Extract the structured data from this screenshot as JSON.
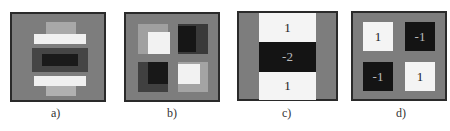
{
  "figure": {
    "panels": [
      {
        "id": "a",
        "label": "a)",
        "description": "Learned vertical second-derivative filter (Gaussian approximation)"
      },
      {
        "id": "b",
        "label": "b)",
        "description": "Learned mixed xy second-derivative filter"
      },
      {
        "id": "c",
        "label": "c)",
        "description": "Box filter approximation Dyy",
        "values": [
          "1",
          "-2",
          "1"
        ]
      },
      {
        "id": "d",
        "label": "d)",
        "description": "Box filter approximation Dxy",
        "values": [
          "1",
          "-1",
          "-1",
          "1"
        ]
      }
    ]
  },
  "colors": {
    "gray": "#7d7d7d",
    "white": "#f4f4f4",
    "black": "#141414",
    "border": "#2a2a2a"
  }
}
